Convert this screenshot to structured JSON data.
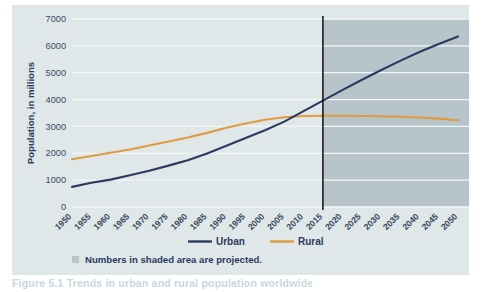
{
  "figure": {
    "background_color": "#dfe7e9",
    "caption": "Figure 5.1  Trends in urban and rural population worldwide"
  },
  "chart_data": {
    "type": "line",
    "title": "",
    "xlabel": "",
    "ylabel": "Population, in millions",
    "x": [
      1950,
      1955,
      1960,
      1965,
      1970,
      1975,
      1980,
      1985,
      1990,
      1995,
      2000,
      2005,
      2010,
      2015,
      2020,
      2025,
      2030,
      2035,
      2040,
      2045,
      2050
    ],
    "categories": [
      "1950",
      "1955",
      "1960",
      "1965",
      "1970",
      "1975",
      "1980",
      "1985",
      "1990",
      "1995",
      "2000",
      "2005",
      "2010",
      "2015",
      "2020",
      "2025",
      "2030",
      "2035",
      "2040",
      "2045",
      "2050"
    ],
    "series": [
      {
        "name": "Urban",
        "color": "#2b3a5e",
        "values": [
          750,
          900,
          1020,
          1180,
          1350,
          1540,
          1740,
          1990,
          2280,
          2570,
          2860,
          3180,
          3570,
          3960,
          4350,
          4730,
          5090,
          5440,
          5770,
          6070,
          6350
        ]
      },
      {
        "name": "Rural",
        "color": "#e09a40",
        "values": [
          1780,
          1900,
          2020,
          2140,
          2290,
          2440,
          2590,
          2760,
          2950,
          3110,
          3250,
          3340,
          3390,
          3400,
          3400,
          3390,
          3380,
          3360,
          3330,
          3290,
          3230
        ]
      }
    ],
    "ylim": [
      0,
      7000
    ],
    "yticks": [
      0,
      1000,
      2000,
      3000,
      4000,
      5000,
      6000,
      7000
    ],
    "ytick_labels": [
      "0",
      "1000",
      "2000",
      "3000",
      "4000",
      "5000",
      "6000",
      "7000"
    ],
    "xlim": [
      1950,
      2050
    ],
    "grid": true,
    "grid_color": "#f2f6f7",
    "legend_position": "bottom",
    "legend_entries": [
      {
        "label": "Urban",
        "color": "#2b3a5e"
      },
      {
        "label": "Rural",
        "color": "#e09a40"
      }
    ],
    "annotations": [
      {
        "type": "vline",
        "x": 2015,
        "color": "#000000",
        "label": ""
      },
      {
        "type": "shaded-region",
        "x_start": 2015,
        "x_end": 2050,
        "color": "#b7c5cb",
        "label": "Numbers in shaded area are projected."
      }
    ],
    "note": {
      "swatch_color": "#b7c5cb",
      "text": "Numbers in shaded area are projected."
    }
  }
}
